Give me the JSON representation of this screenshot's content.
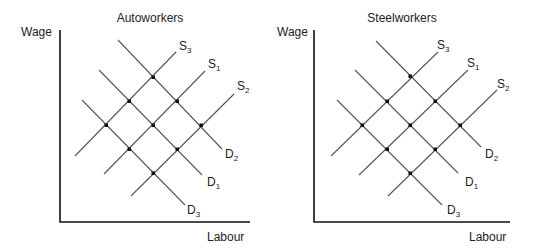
{
  "charts": [
    {
      "title": "Autoworkers",
      "ylabel": "Wage",
      "xlabel": "Labour",
      "supply_labels": [
        {
          "main": "S",
          "sub": "3"
        },
        {
          "main": "S",
          "sub": "1"
        },
        {
          "main": "S",
          "sub": "2"
        }
      ],
      "demand_labels": [
        {
          "main": "D",
          "sub": "2"
        },
        {
          "main": "D",
          "sub": "1"
        },
        {
          "main": "D",
          "sub": "3"
        }
      ]
    },
    {
      "title": "Steelworkers",
      "ylabel": "Wage",
      "xlabel": "Labour",
      "supply_labels": [
        {
          "main": "S",
          "sub": "3"
        },
        {
          "main": "S",
          "sub": "1"
        },
        {
          "main": "S",
          "sub": "2"
        }
      ],
      "demand_labels": [
        {
          "main": "D",
          "sub": "2"
        },
        {
          "main": "D",
          "sub": "1"
        },
        {
          "main": "D",
          "sub": "3"
        }
      ]
    }
  ],
  "colors": {
    "axis": "#111111",
    "line": "#555555",
    "dot": "#111111",
    "text": "#222222"
  }
}
